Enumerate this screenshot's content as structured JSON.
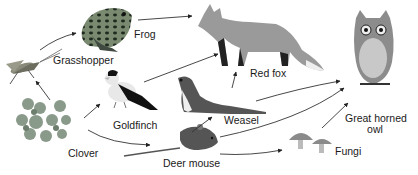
{
  "organisms": {
    "grasshopper": {
      "label": "Grasshopper",
      "icon": "grasshopper-icon"
    },
    "frog": {
      "label": "Frog",
      "icon": "frog-icon"
    },
    "red_fox": {
      "label": "Red fox",
      "icon": "fox-icon"
    },
    "goldfinch": {
      "label": "Goldfinch",
      "icon": "goldfinch-icon"
    },
    "weasel": {
      "label": "Weasel",
      "icon": "weasel-icon"
    },
    "owl_line1": {
      "label": "Great horned"
    },
    "owl_line2": {
      "label": "owl"
    },
    "owl": {
      "icon": "owl-icon"
    },
    "clover": {
      "label": "Clover",
      "icon": "clover-icon"
    },
    "deer_mouse": {
      "label": "Deer mouse",
      "icon": "mouse-icon"
    },
    "fungi": {
      "label": "Fungi",
      "icon": "mushroom-icon"
    }
  },
  "links": [
    {
      "from": "clover",
      "to": "grasshopper"
    },
    {
      "from": "clover",
      "to": "goldfinch"
    },
    {
      "from": "clover",
      "to": "deer_mouse"
    },
    {
      "from": "grasshopper",
      "to": "frog"
    },
    {
      "from": "frog",
      "to": "red_fox"
    },
    {
      "from": "goldfinch",
      "to": "red_fox"
    },
    {
      "from": "weasel",
      "to": "red_fox"
    },
    {
      "from": "deer_mouse",
      "to": "weasel"
    },
    {
      "from": "weasel",
      "to": "great_horned_owl"
    },
    {
      "from": "deer_mouse",
      "to": "great_horned_owl"
    },
    {
      "from": "deer_mouse",
      "to": "fungi"
    },
    {
      "from": "fungi",
      "to": "great_horned_owl"
    }
  ]
}
